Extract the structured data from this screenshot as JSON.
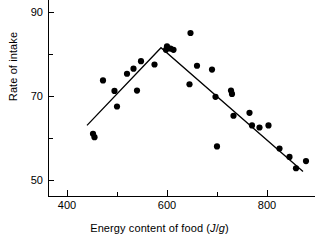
{
  "chart_data": {
    "type": "scatter",
    "title": "",
    "xlabel": "Energy content of food (J/g)",
    "xlabel_parts": {
      "prefix": "Energy content of food (",
      "italic_1": "J",
      "slash": "/",
      "italic_2": "g",
      "suffix": ")"
    },
    "ylabel": "Rate of intake",
    "xlim": [
      355,
      895
    ],
    "ylim": [
      45,
      93
    ],
    "xticks": [
      400,
      600,
      800
    ],
    "xtick_labels": [
      "400",
      "600",
      "800"
    ],
    "x_minor_ticks": [
      500,
      700
    ],
    "yticks": [
      50,
      70,
      90
    ],
    "ytick_labels": [
      "50",
      "70",
      "90"
    ],
    "y_minor_ticks": [
      60,
      80
    ],
    "grid": false,
    "legend": null,
    "series": [
      {
        "name": "observations",
        "marker": "filled-circle",
        "color": "#000000",
        "points": [
          [
            452,
            61.0
          ],
          [
            455,
            60.2
          ],
          [
            472,
            73.7
          ],
          [
            495,
            71.2
          ],
          [
            500,
            67.5
          ],
          [
            520,
            75.3
          ],
          [
            533,
            76.5
          ],
          [
            540,
            71.3
          ],
          [
            548,
            78.3
          ],
          [
            575,
            77.5
          ],
          [
            598,
            81.0
          ],
          [
            600,
            81.8
          ],
          [
            607,
            81.3
          ],
          [
            613,
            81.0
          ],
          [
            647,
            85.0
          ],
          [
            645,
            72.8
          ],
          [
            660,
            77.2
          ],
          [
            690,
            76.3
          ],
          [
            697,
            69.8
          ],
          [
            700,
            58.0
          ],
          [
            728,
            71.3
          ],
          [
            730,
            70.5
          ],
          [
            733,
            65.3
          ],
          [
            765,
            66.0
          ],
          [
            770,
            63.0
          ],
          [
            785,
            62.5
          ],
          [
            803,
            63.0
          ],
          [
            825,
            57.5
          ],
          [
            845,
            55.5
          ],
          [
            858,
            52.8
          ],
          [
            878,
            54.5
          ]
        ]
      },
      {
        "name": "fitted-broken-line",
        "type": "line",
        "color": "#000000",
        "points": [
          [
            440,
            63.0
          ],
          [
            588,
            81.5
          ],
          [
            872,
            52.0
          ]
        ]
      }
    ]
  }
}
